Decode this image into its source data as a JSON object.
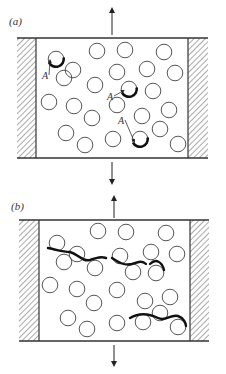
{
  "panels": [
    {
      "label": "(a)",
      "defect_label": "A",
      "frame": {
        "top": 38,
        "bottom": 158,
        "left_block": [
          17,
          36
        ],
        "right_block": [
          188,
          208
        ]
      },
      "arrow_x": 112,
      "arrow_up": [
        10,
        35
      ],
      "arrow_down": [
        162,
        182
      ],
      "circles": [
        [
          56,
          59
        ],
        [
          97,
          51
        ],
        [
          125,
          50
        ],
        [
          164,
          52
        ],
        [
          73,
          70
        ],
        [
          64,
          78
        ],
        [
          117,
          72
        ],
        [
          147,
          69
        ],
        [
          175,
          73
        ],
        [
          95,
          85
        ],
        [
          129,
          89
        ],
        [
          153,
          91
        ],
        [
          49,
          102
        ],
        [
          74,
          106
        ],
        [
          117,
          105
        ],
        [
          142,
          116
        ],
        [
          169,
          110
        ],
        [
          92,
          118
        ],
        [
          66,
          133
        ],
        [
          85,
          145
        ],
        [
          113,
          139
        ],
        [
          140,
          139
        ],
        [
          160,
          129
        ],
        [
          178,
          144
        ]
      ],
      "thick_arcs": [
        [
          56,
          59
        ],
        [
          129,
          89
        ],
        [
          140,
          139
        ]
      ],
      "A_labels": [
        [
          42,
          79
        ],
        [
          107,
          100
        ],
        [
          118,
          124
        ]
      ]
    },
    {
      "label": "(b)",
      "frame": {
        "top": 220,
        "bottom": 341,
        "left_block": [
          19,
          39
        ],
        "right_block": [
          190,
          209
        ]
      },
      "arrow_x": 114,
      "arrow_up": [
        198,
        218
      ],
      "arrow_down": [
        345,
        364
      ],
      "circles": [
        [
          57,
          243
        ],
        [
          98,
          231
        ],
        [
          126,
          232
        ],
        [
          166,
          233
        ],
        [
          77,
          254
        ],
        [
          64,
          262
        ],
        [
          120,
          256
        ],
        [
          151,
          252
        ],
        [
          177,
          254
        ],
        [
          95,
          268
        ],
        [
          133,
          272
        ],
        [
          156,
          273
        ],
        [
          50,
          285
        ],
        [
          77,
          289
        ],
        [
          117,
          290
        ],
        [
          145,
          301
        ],
        [
          170,
          297
        ],
        [
          94,
          303
        ],
        [
          68,
          318
        ],
        [
          87,
          329
        ],
        [
          117,
          323
        ],
        [
          143,
          322
        ],
        [
          160,
          313
        ],
        [
          178,
          327
        ]
      ],
      "cracks": [
        "M48,248 C58,250 62,252 70,252 C78,254 82,262 90,260 C96,258 100,256 106,258",
        "M112,258 C118,262 124,266 132,264 C138,262 142,260 146,264",
        "M150,264 C156,258 162,262 164,270",
        "M130,318 C140,312 150,314 158,318 C166,322 170,314 178,316 C184,318 186,324 186,326"
      ]
    }
  ]
}
